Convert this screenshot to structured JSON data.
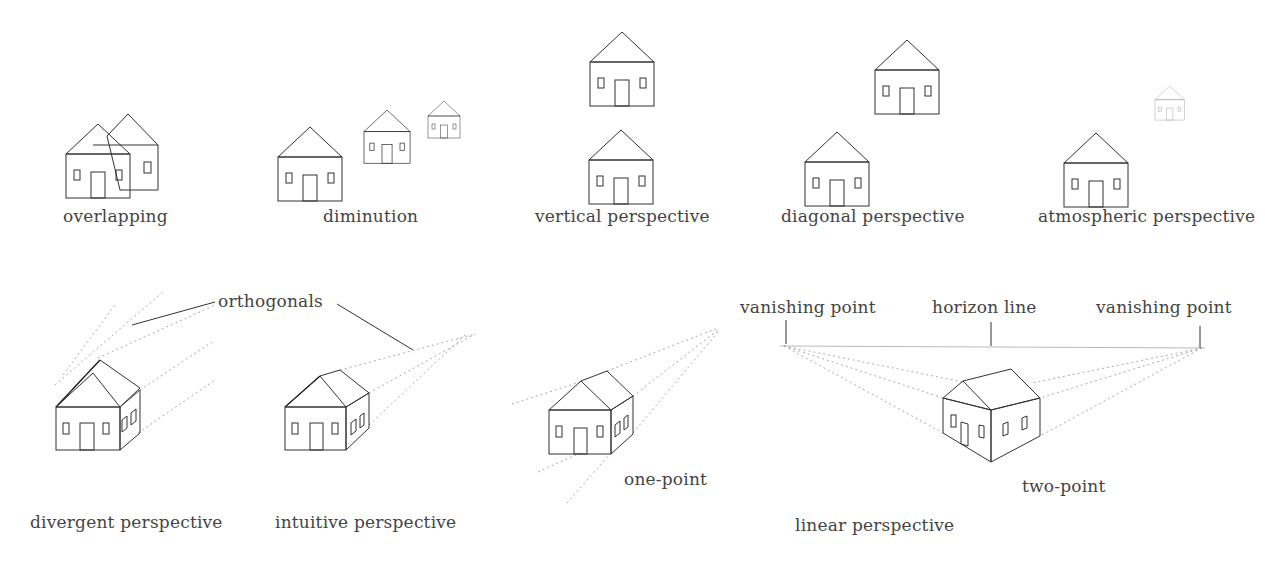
{
  "labels": {
    "overlapping": "overlapping",
    "diminution": "diminution",
    "vertical": "vertical perspective",
    "diagonal": "diagonal perspective",
    "atmospheric": "atmospheric perspective",
    "orthogonals": "orthogonals",
    "vanishing_left": "vanishing point",
    "horizon": "horizon line",
    "vanishing_right": "vanishing point",
    "one_point": "one-point",
    "two_point": "two-point",
    "divergent": "divergent perspective",
    "intuitive": "intuitive perspective",
    "linear": "linear perspective"
  },
  "colors": {
    "line": "#333333",
    "guide": "#aaaaaa",
    "text": "#444444"
  }
}
